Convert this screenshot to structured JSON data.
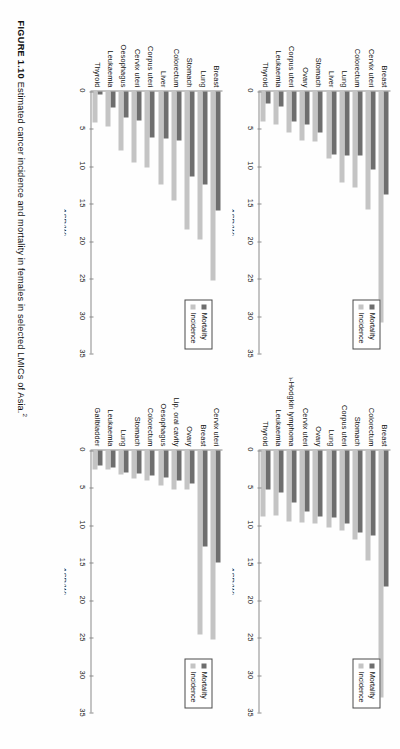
{
  "figure": {
    "label": "FIGURE 1.10",
    "caption": "Estimated cancer incidence and mortality in females in selected LMICs of Asia.",
    "reference_marker": "2"
  },
  "legend": {
    "mortality_label": "Mortality",
    "incidence_label": "Incidence",
    "mortality_color": "#6e6e6e",
    "incidence_color": "#c4c4c4"
  },
  "axis": {
    "title": "ASR(W)",
    "ticks": [
      "0",
      "5",
      "10",
      "15",
      "20",
      "25",
      "30",
      "35"
    ],
    "min": 0,
    "max": 35
  },
  "chart_data": [
    {
      "id": "panel-1",
      "type": "bar",
      "title": "",
      "xlabel": "ASR(W)",
      "ylabel": "",
      "xlim": [
        0,
        35
      ],
      "grid": false,
      "legend_position": "top-right",
      "categories": [
        "Breast",
        "Cervix uteri",
        "Colorectum",
        "Lung",
        "Liver",
        "Stomach",
        "Ovary",
        "Corpus uteri",
        "Leukaemia",
        "Thyroid"
      ],
      "series": [
        {
          "name": "Mortality",
          "values": [
            13.8,
            10.4,
            8.5,
            8.5,
            8.4,
            5.5,
            4.4,
            4.0,
            2.0,
            1.6
          ]
        },
        {
          "name": "Incidence",
          "values": [
            30.9,
            15.7,
            12.8,
            12.2,
            8.9,
            6.7,
            6.5,
            5.5,
            4.4,
            4.0
          ]
        }
      ]
    },
    {
      "id": "panel-2",
      "type": "bar",
      "title": "",
      "xlabel": "ASR(W)",
      "ylabel": "",
      "xlim": [
        0,
        35
      ],
      "grid": false,
      "legend_position": "top-right",
      "categories": [
        "Breast",
        "Colorectum",
        "Stomach",
        "Corpus uteri",
        "Lung",
        "Ovary",
        "Cervix uteri",
        "Non-Hodgkin lymphoma",
        "Leukaemia",
        "Thyroid"
      ],
      "series": [
        {
          "name": "Mortality",
          "values": [
            18.2,
            11.4,
            11.0,
            9.8,
            8.9,
            8.8,
            8.2,
            7.0,
            5.6,
            5.2
          ]
        },
        {
          "name": "Incidence",
          "values": [
            33.0,
            14.7,
            11.9,
            10.7,
            10.3,
            9.8,
            9.6,
            9.5,
            8.7,
            8.8
          ]
        }
      ]
    },
    {
      "id": "panel-3",
      "type": "bar",
      "title": "",
      "xlabel": "ASR(W)",
      "ylabel": "",
      "xlim": [
        0,
        35
      ],
      "grid": false,
      "legend_position": "top-right",
      "categories": [
        "Breast",
        "Lung",
        "Stomach",
        "Colorectum",
        "Liver",
        "Corpus uteri",
        "Cervix uteri",
        "Oesophagus",
        "Leukaemia",
        "Thyroid"
      ],
      "series": [
        {
          "name": "Mortality",
          "values": [
            15.9,
            12.4,
            11.3,
            6.5,
            6.3,
            6.2,
            3.9,
            3.5,
            2.1,
            0.4
          ]
        },
        {
          "name": "Incidence",
          "values": [
            25.2,
            19.8,
            18.5,
            14.6,
            12.4,
            10.1,
            9.5,
            7.9,
            4.7,
            4.1
          ]
        }
      ]
    },
    {
      "id": "panel-4",
      "type": "bar",
      "title": "",
      "xlabel": "ASR(W)",
      "ylabel": "",
      "xlim": [
        0,
        35
      ],
      "grid": false,
      "legend_position": "top-right",
      "categories": [
        "Cervix uteri",
        "Breast",
        "Ovary",
        "Lip, oral cavity",
        "Oesophagus",
        "Colorectum",
        "Stomach",
        "Lung",
        "Leukaemia",
        "Gallbladder"
      ],
      "series": [
        {
          "name": "Mortality",
          "values": [
            15.0,
            12.8,
            4.4,
            4.0,
            3.6,
            3.4,
            3.1,
            2.9,
            2.3,
            2.0
          ]
        },
        {
          "name": "Incidence",
          "values": [
            25.2,
            24.6,
            5.2,
            5.2,
            4.7,
            4.0,
            3.7,
            3.2,
            2.6,
            2.5
          ]
        }
      ]
    }
  ]
}
